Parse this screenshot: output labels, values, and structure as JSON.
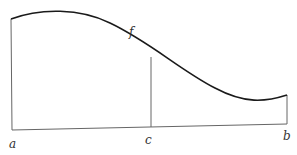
{
  "diagram": {
    "type": "function-area",
    "labels": {
      "function": "f",
      "left_endpoint": "a",
      "midpoint": "c",
      "right_endpoint": "b"
    },
    "colors": {
      "curve": "#1a1a1a",
      "lines": "#555555",
      "text": "#333333",
      "background": "#ffffff"
    }
  }
}
